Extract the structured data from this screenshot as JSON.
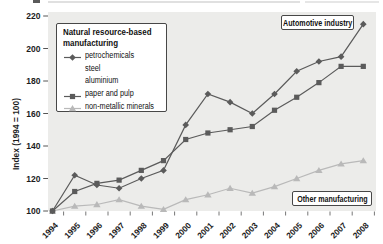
{
  "chart_data": {
    "type": "line",
    "title": "",
    "xlabel": "",
    "ylabel": "Index (1994 = 100)",
    "x": [
      "1994",
      "1995",
      "1996",
      "1997",
      "1998",
      "1999",
      "2000",
      "2001",
      "2002",
      "2003",
      "2004",
      "2005",
      "2006",
      "2007",
      "2008"
    ],
    "ylim": [
      100,
      220
    ],
    "yticks": [
      100,
      120,
      140,
      160,
      180,
      200,
      220
    ],
    "grid": false,
    "plot_bg_color": "#ececea",
    "legend_position": "upper-left boxed",
    "series": [
      {
        "name": "petrochemicals",
        "marker": "diamond",
        "color": "#5b5b5b",
        "values": [
          100,
          122,
          116,
          114,
          120,
          125,
          153,
          172,
          167,
          160,
          172,
          186,
          192,
          195,
          215
        ]
      },
      {
        "name": "paper and pulp",
        "marker": "square",
        "color": "#5b5b5b",
        "values": [
          100,
          112,
          117,
          119,
          125,
          131,
          144,
          148,
          150,
          152,
          162,
          170,
          179,
          189,
          189
        ]
      },
      {
        "name": "non-metallic minerals",
        "marker": "triangle",
        "color": "#b9b9b9",
        "values": [
          100,
          103,
          104,
          107,
          103,
          101,
          107,
          110,
          114,
          111,
          115,
          120,
          125,
          129,
          131
        ]
      }
    ]
  },
  "legend": {
    "title": [
      "Natural resource-based",
      "manufacturing"
    ],
    "items": [
      {
        "label": "petrochemicals",
        "marker": "diamond",
        "color": "#5b5b5b"
      },
      {
        "label": "steel",
        "marker": "none",
        "color": ""
      },
      {
        "label": "aluminium",
        "marker": "none",
        "color": ""
      },
      {
        "label": "paper and pulp",
        "marker": "square",
        "color": "#5b5b5b"
      },
      {
        "label": "non-metallic minerals",
        "marker": "triangle",
        "color": "#b9b9b9"
      }
    ]
  },
  "annotations": {
    "automotive": "Automotive industry",
    "other": "Other manufacturing"
  }
}
